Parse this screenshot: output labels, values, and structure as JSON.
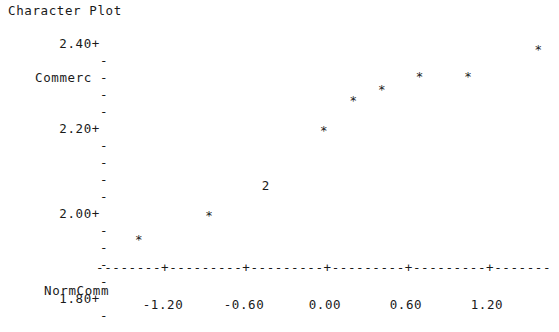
{
  "window": {
    "title": "Character Plot",
    "background": "#ffffff",
    "ink": "#1a1a1a"
  },
  "chart_data": {
    "type": "scatter",
    "title": "Character Plot",
    "xlabel": "NormComm",
    "ylabel": "Commerc",
    "style": "minitab-character-plot",
    "grid": false,
    "legend": null,
    "xlim": [
      -1.55,
      1.95
    ],
    "ylim": [
      1.76,
      2.44
    ],
    "xticks": [
      "-1.20",
      "-0.60",
      "0.00",
      "0.60",
      "1.20"
    ],
    "xtick_values": [
      -1.2,
      -0.6,
      0.0,
      0.6,
      1.2
    ],
    "yticks": [
      "2.40+",
      "2.20+",
      "2.00+",
      "1.80+"
    ],
    "ytick_values": [
      2.4,
      2.2,
      2.0,
      1.8
    ],
    "y_minor_tick_glyph": "-",
    "x_axis_glyph_dash": "-",
    "x_axis_glyph_tick": "+",
    "point_glyph": "*",
    "overlap_glyph": "2",
    "points": [
      {
        "x": -1.38,
        "y": 1.815,
        "glyph": "*",
        "count": 1
      },
      {
        "x": -0.86,
        "y": 1.885,
        "glyph": "*",
        "count": 1
      },
      {
        "x": -0.44,
        "y": 1.975,
        "glyph": "2",
        "count": 2
      },
      {
        "x": -0.01,
        "y": 2.135,
        "glyph": "*",
        "count": 1
      },
      {
        "x": 0.21,
        "y": 2.225,
        "glyph": "*",
        "count": 1
      },
      {
        "x": 0.42,
        "y": 2.255,
        "glyph": "*",
        "count": 1
      },
      {
        "x": 0.7,
        "y": 2.295,
        "glyph": "*",
        "count": 1
      },
      {
        "x": 1.06,
        "y": 2.295,
        "glyph": "*",
        "count": 1
      },
      {
        "x": 1.58,
        "y": 2.375,
        "glyph": "*",
        "count": 1
      }
    ],
    "n_observations": 10
  },
  "axes": {
    "y_rows": [
      {
        "label": "2.40+",
        "kind": "major"
      },
      {
        "label": "-",
        "kind": "minor"
      },
      {
        "label": "-",
        "kind": "minor",
        "name": "Commerc"
      },
      {
        "label": "-",
        "kind": "minor"
      },
      {
        "label": "-",
        "kind": "minor"
      },
      {
        "label": "2.20+",
        "kind": "major"
      },
      {
        "label": "-",
        "kind": "minor"
      },
      {
        "label": "-",
        "kind": "minor"
      },
      {
        "label": "-",
        "kind": "minor"
      },
      {
        "label": "-",
        "kind": "minor"
      },
      {
        "label": "2.00+",
        "kind": "major"
      },
      {
        "label": "-",
        "kind": "minor"
      },
      {
        "label": "-",
        "kind": "minor"
      },
      {
        "label": "-",
        "kind": "minor"
      },
      {
        "label": "-",
        "kind": "minor"
      },
      {
        "label": "1.80+",
        "kind": "major"
      },
      {
        "label": "-",
        "kind": "minor"
      }
    ],
    "y_axis_name": "Commerc",
    "x_axis_name": "NormComm"
  }
}
